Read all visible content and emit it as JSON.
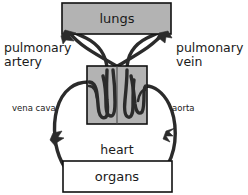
{
  "diagram": {
    "colors": {
      "organ_fill_gray": "#b3b3b3",
      "organ_fill_white": "#ffffff",
      "organ_stroke": "#111111",
      "vessel_stroke": "#2b2b2b",
      "background": "#ffffff",
      "text": "#1a1a1a"
    },
    "boxes": [
      {
        "key": "lungs",
        "label": "lungs",
        "fill": "gray",
        "x": 62,
        "y": 3,
        "w": 109,
        "h": 31
      },
      {
        "key": "heart",
        "label": "",
        "fill": "gray",
        "x": 87,
        "y": 66,
        "w": 60,
        "h": 58
      },
      {
        "key": "organs",
        "label": "organs",
        "fill": "white",
        "x": 63,
        "y": 161,
        "w": 109,
        "h": 31
      }
    ],
    "labels": [
      {
        "key": "pulmonary-artery",
        "line1": "pulmonary",
        "line2": "artery",
        "x": 4,
        "y": 48,
        "anchor": "start",
        "size": "large"
      },
      {
        "key": "pulmonary-vein",
        "line1": "pulmonary",
        "line2": "vein",
        "x": 176,
        "y": 48,
        "anchor": "start",
        "size": "large"
      },
      {
        "key": "vena-cava",
        "line1": "vena cava",
        "line2": "",
        "x": 12,
        "y": 108,
        "anchor": "start",
        "size": "small"
      },
      {
        "key": "aorta",
        "line1": "aorta",
        "line2": "",
        "x": 172,
        "y": 108,
        "anchor": "start",
        "size": "small"
      },
      {
        "key": "heart",
        "line1": "heart",
        "line2": "",
        "x": 117,
        "y": 150,
        "anchor": "middle",
        "size": "large"
      }
    ],
    "vessels": [
      {
        "key": "pulmonary-artery-path",
        "from": "heart",
        "to": "lungs",
        "side": "left",
        "direction": "up"
      },
      {
        "key": "pulmonary-vein-path",
        "from": "lungs",
        "to": "heart",
        "side": "right",
        "direction": "down"
      },
      {
        "key": "vena-cava-path",
        "from": "organs",
        "to": "heart",
        "side": "left",
        "direction": "up"
      },
      {
        "key": "aorta-path",
        "from": "heart",
        "to": "organs",
        "side": "right",
        "direction": "down"
      }
    ],
    "arrow_count": 4
  }
}
